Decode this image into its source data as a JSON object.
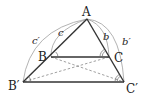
{
  "diagram": {
    "title": "",
    "points": {
      "A": {
        "label": "A",
        "x": 87,
        "y": 19
      },
      "B": {
        "label": "B",
        "x": 51,
        "y": 57
      },
      "C": {
        "label": "C",
        "x": 109,
        "y": 57
      },
      "Bp": {
        "label": "B′",
        "x": 23,
        "y": 82
      },
      "Cp": {
        "label": "C′",
        "x": 124,
        "y": 82
      }
    },
    "side_labels": {
      "c": "c",
      "b": "b",
      "cp": "c′",
      "bp": "b′"
    },
    "colors": {
      "solid": "#333333",
      "dashed": "#777777",
      "arc": "#999999"
    }
  }
}
